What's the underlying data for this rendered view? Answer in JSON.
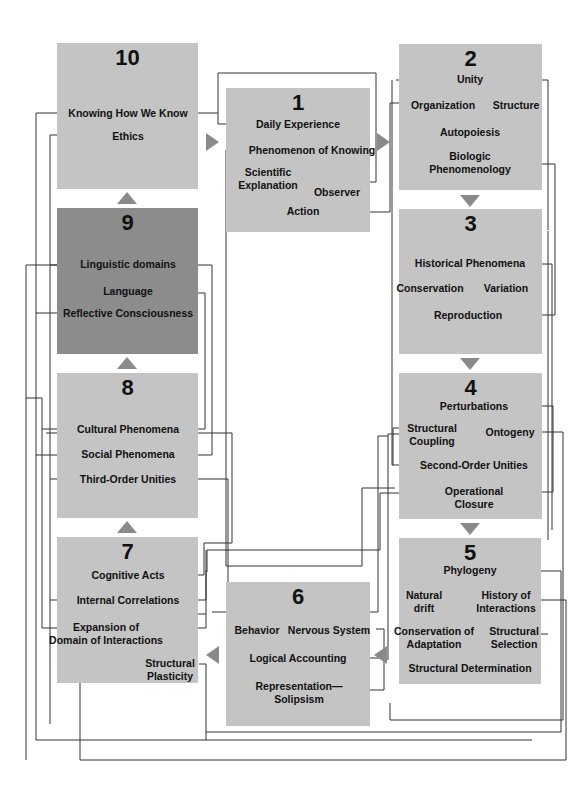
{
  "colors": {
    "box": "#c4c4c4",
    "box_highlight": "#8c8c8c",
    "arrow": "#8a8a8a",
    "wire": "#333333"
  },
  "boxes": [
    {
      "number": "1",
      "labels": [
        "Daily Experience",
        "Phenomenon of Knowing",
        "Scientific\nExplanation",
        "Observer",
        "Action"
      ]
    },
    {
      "number": "2",
      "labels": [
        "Unity",
        "Organization",
        "Structure",
        "Autopoiesis",
        "Biologic\nPhenomenology"
      ]
    },
    {
      "number": "3",
      "labels": [
        "Historical Phenomena",
        "Conservation",
        "Variation",
        "Reproduction"
      ]
    },
    {
      "number": "4",
      "labels": [
        "Perturbations",
        "Structural\nCoupling",
        "Ontogeny",
        "Second-Order Unities",
        "Operational\nClosure"
      ]
    },
    {
      "number": "5",
      "labels": [
        "Phylogeny",
        "Natural\ndrift",
        "History of\nInteractions",
        "Conservation of\nAdaptation",
        "Structural\nSelection",
        "Structural Determination"
      ]
    },
    {
      "number": "6",
      "labels": [
        "Behavior",
        "Nervous System",
        "Logical Accounting",
        "Representation—\nSolipsism"
      ]
    },
    {
      "number": "7",
      "labels": [
        "Cognitive Acts",
        "Internal Correlations",
        "Expansion of\nDomain of Interactions",
        "Structural\nPlasticity"
      ]
    },
    {
      "number": "8",
      "labels": [
        "Cultural Phenomena",
        "Social Phenomena",
        "Third-Order Unities"
      ]
    },
    {
      "number": "9",
      "labels": [
        "Linguistic domains",
        "Language",
        "Reflective Consciousness"
      ]
    },
    {
      "number": "10",
      "labels": [
        "Knowing How We Know",
        "Ethics"
      ]
    }
  ]
}
